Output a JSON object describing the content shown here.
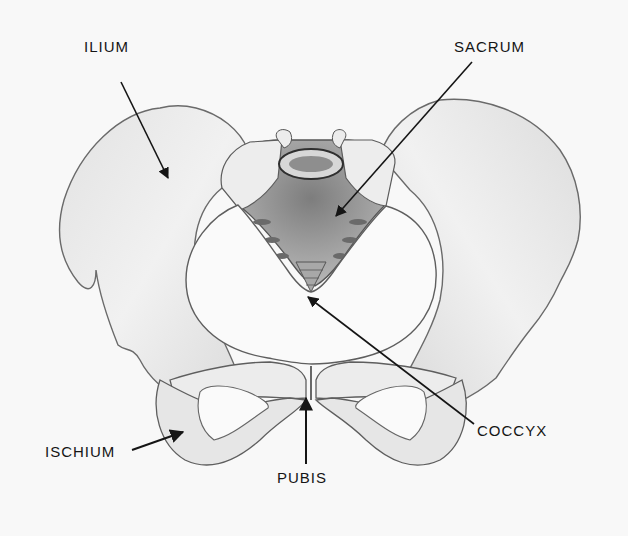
{
  "diagram": {
    "labels": {
      "ilium": "ILIUM",
      "sacrum": "SACRUM",
      "coccyx": "COCCYX",
      "ischium": "ISCHIUM",
      "pubis": "PUBIS"
    },
    "colors": {
      "background": "#f8f8f8",
      "ink": "#151515",
      "bone_fill": "#efefef",
      "bone_outline": "#6a6a6a",
      "shading": "#9a9a9a"
    }
  }
}
